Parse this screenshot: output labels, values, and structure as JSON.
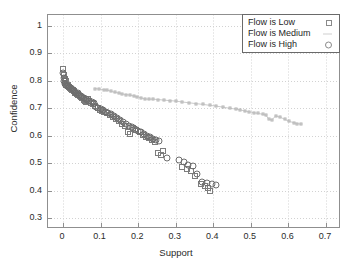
{
  "chart_data": {
    "type": "scatter",
    "title": "",
    "xlabel": "Support",
    "ylabel": "Confidence",
    "xlim": [
      -0.04,
      0.74
    ],
    "ylim": [
      0.26,
      1.04
    ],
    "xticks": [
      "0",
      "0.1",
      "0.2",
      "0.3",
      "0.4",
      "0.5",
      "0.6",
      "0.7"
    ],
    "xtick_values": [
      0,
      0.1,
      0.2,
      0.3,
      0.4,
      0.5,
      0.6,
      0.7
    ],
    "yticks": [
      "0.3",
      "0.4",
      "0.5",
      "0.6",
      "0.7",
      "0.8",
      "0.9",
      "1"
    ],
    "ytick_values": [
      0.3,
      0.4,
      0.5,
      0.6,
      0.7,
      0.8,
      0.9,
      1.0
    ],
    "grid": true,
    "legend_position": "top-right",
    "legend": [
      {
        "label": "Flow is Low",
        "marker": "square"
      },
      {
        "label": "Flow is Medium",
        "marker": "line"
      },
      {
        "label": "Flow is High",
        "marker": "circle"
      }
    ],
    "series": [
      {
        "name": "Flow is Low",
        "marker": "square",
        "color": "#7d7d7d",
        "points": [
          [
            0.001,
            0.845
          ],
          [
            0.002,
            0.822
          ],
          [
            0.004,
            0.806
          ],
          [
            0.005,
            0.792
          ],
          [
            0.007,
            0.8
          ],
          [
            0.009,
            0.786
          ],
          [
            0.012,
            0.784
          ],
          [
            0.015,
            0.779
          ],
          [
            0.018,
            0.775
          ],
          [
            0.021,
            0.772
          ],
          [
            0.024,
            0.768
          ],
          [
            0.027,
            0.765
          ],
          [
            0.03,
            0.762
          ],
          [
            0.033,
            0.756
          ],
          [
            0.036,
            0.752
          ],
          [
            0.04,
            0.749
          ],
          [
            0.044,
            0.745
          ],
          [
            0.047,
            0.74
          ],
          [
            0.051,
            0.736
          ],
          [
            0.055,
            0.731
          ],
          [
            0.058,
            0.727
          ],
          [
            0.062,
            0.722
          ],
          [
            0.066,
            0.733
          ],
          [
            0.07,
            0.728
          ],
          [
            0.075,
            0.718
          ],
          [
            0.08,
            0.714
          ],
          [
            0.086,
            0.709
          ],
          [
            0.092,
            0.7
          ],
          [
            0.098,
            0.695
          ],
          [
            0.104,
            0.69
          ],
          [
            0.11,
            0.686
          ],
          [
            0.118,
            0.681
          ],
          [
            0.126,
            0.676
          ],
          [
            0.134,
            0.668
          ],
          [
            0.142,
            0.66
          ],
          [
            0.15,
            0.652
          ],
          [
            0.158,
            0.644
          ],
          [
            0.166,
            0.636
          ],
          [
            0.172,
            0.613
          ],
          [
            0.178,
            0.607
          ],
          [
            0.186,
            0.628
          ],
          [
            0.195,
            0.62
          ],
          [
            0.204,
            0.612
          ],
          [
            0.213,
            0.604
          ],
          [
            0.221,
            0.596
          ],
          [
            0.23,
            0.59
          ],
          [
            0.238,
            0.584
          ],
          [
            0.245,
            0.578
          ],
          [
            0.252,
            0.537
          ],
          [
            0.26,
            0.53
          ],
          [
            0.266,
            0.545
          ],
          [
            0.318,
            0.487
          ],
          [
            0.33,
            0.48
          ],
          [
            0.34,
            0.472
          ],
          [
            0.352,
            0.455
          ],
          [
            0.366,
            0.425
          ],
          [
            0.378,
            0.418
          ],
          [
            0.386,
            0.411
          ],
          [
            0.392,
            0.4
          ]
        ]
      },
      {
        "name": "Flow is Medium",
        "marker": "line",
        "color": "#c0c0c0",
        "points": [
          [
            0.085,
            0.772
          ],
          [
            0.096,
            0.77
          ],
          [
            0.108,
            0.768
          ],
          [
            0.118,
            0.766
          ],
          [
            0.128,
            0.762
          ],
          [
            0.138,
            0.758
          ],
          [
            0.148,
            0.756
          ],
          [
            0.158,
            0.752
          ],
          [
            0.168,
            0.75
          ],
          [
            0.178,
            0.748
          ],
          [
            0.188,
            0.745
          ],
          [
            0.198,
            0.742
          ],
          [
            0.208,
            0.738
          ],
          [
            0.218,
            0.734
          ],
          [
            0.228,
            0.733
          ],
          [
            0.24,
            0.733
          ],
          [
            0.252,
            0.732
          ],
          [
            0.268,
            0.73
          ],
          [
            0.284,
            0.728
          ],
          [
            0.3,
            0.726
          ],
          [
            0.318,
            0.723
          ],
          [
            0.336,
            0.72
          ],
          [
            0.354,
            0.717
          ],
          [
            0.372,
            0.714
          ],
          [
            0.39,
            0.711
          ],
          [
            0.408,
            0.708
          ],
          [
            0.426,
            0.704
          ],
          [
            0.444,
            0.7
          ],
          [
            0.46,
            0.697
          ],
          [
            0.472,
            0.694
          ],
          [
            0.484,
            0.69
          ],
          [
            0.496,
            0.687
          ],
          [
            0.508,
            0.684
          ],
          [
            0.52,
            0.681
          ],
          [
            0.532,
            0.678
          ],
          [
            0.54,
            0.675
          ],
          [
            0.548,
            0.66
          ],
          [
            0.556,
            0.658
          ],
          [
            0.566,
            0.672
          ],
          [
            0.578,
            0.668
          ],
          [
            0.59,
            0.66
          ],
          [
            0.602,
            0.652
          ],
          [
            0.614,
            0.648
          ],
          [
            0.624,
            0.644
          ],
          [
            0.634,
            0.642
          ]
        ]
      },
      {
        "name": "Flow is High",
        "marker": "circle",
        "color": "#6e6e6e",
        "points": [
          [
            0.0,
            0.828
          ],
          [
            0.002,
            0.812
          ],
          [
            0.003,
            0.798
          ],
          [
            0.005,
            0.79
          ],
          [
            0.008,
            0.786
          ],
          [
            0.011,
            0.782
          ],
          [
            0.014,
            0.78
          ],
          [
            0.017,
            0.777
          ],
          [
            0.02,
            0.774
          ],
          [
            0.023,
            0.77
          ],
          [
            0.026,
            0.767
          ],
          [
            0.029,
            0.764
          ],
          [
            0.032,
            0.76
          ],
          [
            0.035,
            0.757
          ],
          [
            0.039,
            0.754
          ],
          [
            0.043,
            0.75
          ],
          [
            0.047,
            0.746
          ],
          [
            0.051,
            0.742
          ],
          [
            0.055,
            0.738
          ],
          [
            0.06,
            0.734
          ],
          [
            0.065,
            0.73
          ],
          [
            0.07,
            0.726
          ],
          [
            0.076,
            0.722
          ],
          [
            0.082,
            0.718
          ],
          [
            0.088,
            0.705
          ],
          [
            0.094,
            0.7
          ],
          [
            0.1,
            0.696
          ],
          [
            0.107,
            0.692
          ],
          [
            0.114,
            0.688
          ],
          [
            0.12,
            0.684
          ],
          [
            0.128,
            0.678
          ],
          [
            0.136,
            0.672
          ],
          [
            0.144,
            0.665
          ],
          [
            0.152,
            0.658
          ],
          [
            0.16,
            0.65
          ],
          [
            0.168,
            0.644
          ],
          [
            0.176,
            0.636
          ],
          [
            0.184,
            0.63
          ],
          [
            0.192,
            0.624
          ],
          [
            0.2,
            0.618
          ],
          [
            0.208,
            0.612
          ],
          [
            0.216,
            0.606
          ],
          [
            0.224,
            0.6
          ],
          [
            0.232,
            0.594
          ],
          [
            0.24,
            0.588
          ],
          [
            0.248,
            0.584
          ],
          [
            0.256,
            0.58
          ],
          [
            0.276,
            0.52
          ],
          [
            0.31,
            0.512
          ],
          [
            0.322,
            0.505
          ],
          [
            0.334,
            0.492
          ],
          [
            0.346,
            0.488
          ],
          [
            0.356,
            0.462
          ],
          [
            0.37,
            0.432
          ],
          [
            0.382,
            0.428
          ],
          [
            0.396,
            0.424
          ],
          [
            0.408,
            0.422
          ]
        ]
      }
    ]
  }
}
